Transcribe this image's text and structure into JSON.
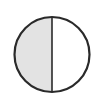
{
  "diagram": {
    "type": "fraction-circle",
    "parts_total": 2,
    "parts_shaded": 1,
    "fraction": "1/2",
    "colors": {
      "shaded": "#e3e3e3",
      "unshaded": "#ffffff",
      "stroke": "#2a2a2a"
    }
  }
}
